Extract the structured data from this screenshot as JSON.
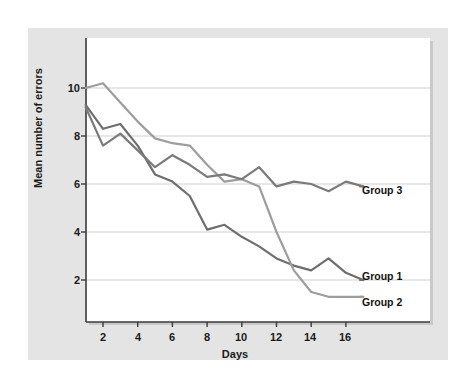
{
  "figure": {
    "background_color": "#ffffff",
    "panel_color": "#e4e4e4",
    "canvas_color": "#ffffff"
  },
  "chart_data": {
    "type": "line",
    "title": "",
    "xlabel": "Days",
    "ylabel": "Mean number of errors",
    "xlim": [
      0.6,
      18.2
    ],
    "ylim": [
      0.0,
      11.6
    ],
    "xticks": [
      2,
      4,
      6,
      8,
      10,
      12,
      14,
      16
    ],
    "yticks": [
      2,
      4,
      6,
      8,
      10
    ],
    "grid": "horizontal",
    "grid_color": "#d0d0d0",
    "legend_position": "right-inline-labels",
    "x": [
      1,
      2,
      3,
      4,
      5,
      6,
      7,
      8,
      9,
      10,
      11,
      12,
      13,
      14,
      15,
      16,
      17
    ],
    "series": [
      {
        "name": "Group 1",
        "color": "#6e6e6e",
        "label": "Group 1",
        "values": [
          9.3,
          8.3,
          8.5,
          7.6,
          6.4,
          6.1,
          5.5,
          4.1,
          4.3,
          3.8,
          3.4,
          2.9,
          2.6,
          2.4,
          2.9,
          2.3,
          2.0
        ]
      },
      {
        "name": "Group 2",
        "color": "#9d9d9d",
        "label": "Group 2",
        "values": [
          10.0,
          10.2,
          9.4,
          8.6,
          7.9,
          7.7,
          7.6,
          6.8,
          6.1,
          6.2,
          5.9,
          4.0,
          2.4,
          1.5,
          1.3,
          1.3,
          1.3
        ]
      },
      {
        "name": "Group 3",
        "color": "#7a7a7a",
        "label": "Group 3",
        "values": [
          9.2,
          7.6,
          8.1,
          7.4,
          6.7,
          7.2,
          6.8,
          6.3,
          6.4,
          6.2,
          6.7,
          5.9,
          6.1,
          6.0,
          5.7,
          6.1,
          5.9
        ]
      }
    ],
    "annotations": [
      {
        "text": "Group 3",
        "x_px": 362,
        "y_px": 190
      },
      {
        "text": "Group 1",
        "x_px": 362,
        "y_px": 276
      },
      {
        "text": "Group 2",
        "x_px": 362,
        "y_px": 302
      }
    ]
  },
  "axis": {
    "y_title": "Mean number of errors",
    "x_title": "Days",
    "y_tick_labels": [
      "10",
      "8",
      "6",
      "4",
      "2"
    ],
    "x_tick_labels": [
      "2",
      "4",
      "6",
      "8",
      "10",
      "12",
      "14",
      "16"
    ]
  }
}
